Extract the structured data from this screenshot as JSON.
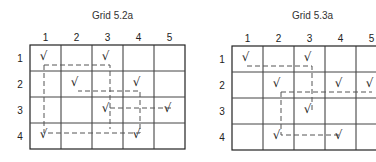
{
  "grids": [
    {
      "title": "Grid 5.2a",
      "columns": [
        "1",
        "2",
        "3",
        "4",
        "5"
      ],
      "rows": [
        "1",
        "2",
        "3",
        "4"
      ],
      "checks": [
        [
          1,
          1
        ],
        [
          1,
          3
        ],
        [
          2,
          2
        ],
        [
          2,
          4
        ],
        [
          3,
          3
        ],
        [
          3,
          5
        ],
        [
          4,
          1
        ],
        [
          4,
          4
        ]
      ],
      "check_symbol": "√"
    },
    {
      "title": "Grid 5.3a",
      "columns": [
        "1",
        "2",
        "3",
        "4",
        "5"
      ],
      "rows": [
        "1",
        "2",
        "3",
        "4"
      ],
      "checks": [
        [
          1,
          1
        ],
        [
          1,
          3
        ],
        [
          2,
          2
        ],
        [
          2,
          4
        ],
        [
          2,
          5
        ],
        [
          3,
          3
        ],
        [
          4,
          2
        ],
        [
          4,
          4
        ]
      ],
      "check_symbol": "√"
    }
  ]
}
